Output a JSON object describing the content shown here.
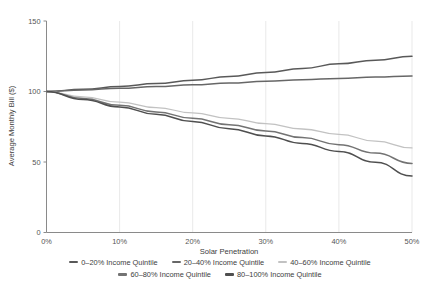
{
  "chart_data": {
    "type": "line",
    "title": "",
    "xlabel": "Solar Penetration",
    "ylabel": "Average Monthly Bill ($)",
    "xlim": [
      0,
      50
    ],
    "ylim": [
      0,
      150
    ],
    "xticks": [
      "0%",
      "10%",
      "20%",
      "30%",
      "40%",
      "50%"
    ],
    "xtick_values": [
      0,
      10,
      20,
      30,
      40,
      50
    ],
    "yticks": [
      "0",
      "50",
      "100",
      "150"
    ],
    "ytick_values": [
      0,
      50,
      100,
      150
    ],
    "grid": "vertical-only",
    "legend_position": "bottom",
    "x": [
      0,
      5,
      10,
      15,
      20,
      25,
      30,
      35,
      40,
      45,
      50
    ],
    "series": [
      {
        "name": "0–20% Income Quintile",
        "color": "#595959",
        "width": 1.5,
        "values": [
          100,
          101.6,
          103.5,
          105.6,
          108.0,
          110.6,
          113.4,
          116.4,
          119.6,
          122.2,
          125.0
        ]
      },
      {
        "name": "20–40% Income Quintile",
        "color": "#676767",
        "width": 1.5,
        "values": [
          100,
          101.1,
          102.3,
          103.5,
          104.8,
          106.0,
          107.2,
          108.3,
          109.3,
          110.2,
          111.0
        ]
      },
      {
        "name": "40–60% Income Quintile",
        "color": "#c2c2c2",
        "width": 1.3,
        "values": [
          100,
          96.2,
          92.4,
          88.6,
          84.8,
          81.0,
          77.2,
          73.4,
          69.6,
          64.8,
          60.0
        ]
      },
      {
        "name": "60–80% Income Quintile",
        "color": "#737373",
        "width": 1.5,
        "values": [
          100,
          95.0,
          90.2,
          85.5,
          81.0,
          76.5,
          72.0,
          67.3,
          62.3,
          56.3,
          49.0
        ]
      },
      {
        "name": "80–100% Income Quintile",
        "color": "#4f4f4f",
        "width": 1.5,
        "values": [
          100,
          94.4,
          89.0,
          83.8,
          78.7,
          73.6,
          68.5,
          63.2,
          57.5,
          49.8,
          40.0
        ]
      }
    ]
  },
  "legend": {
    "rows": [
      [
        {
          "label": "0–20% Income Quintile",
          "color": "#595959"
        },
        {
          "label": "20–40% Income Quintile",
          "color": "#676767"
        },
        {
          "label": "40–60% Income Quintile",
          "color": "#c2c2c2"
        }
      ],
      [
        {
          "label": "60–80% Income Quintile",
          "color": "#737373"
        },
        {
          "label": "80–100% Income Quintile",
          "color": "#4f4f4f"
        }
      ]
    ]
  }
}
